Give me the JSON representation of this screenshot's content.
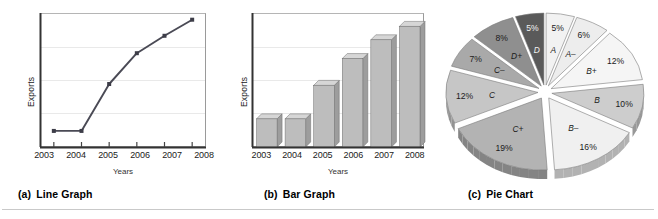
{
  "figure": {
    "bottom_rule": true
  },
  "panels": {
    "line": {
      "caption_index": "(a)",
      "caption_label": "Line Graph",
      "y_axis_label": "Exports",
      "x_axis_title": "Years"
    },
    "bar": {
      "caption_index": "(b)",
      "caption_label": "Bar Graph",
      "y_axis_label": "Exports",
      "x_axis_title": "Years"
    },
    "pie": {
      "caption_index": "(c)",
      "caption_label": "Pie Chart"
    }
  },
  "chart_data": [
    {
      "type": "line",
      "title": "Line Graph",
      "xlabel": "Years",
      "ylabel": "Exports",
      "categories": [
        "2003",
        "2004",
        "2005",
        "2006",
        "2007",
        "2008"
      ],
      "values": [
        12,
        12,
        47,
        70,
        83,
        95
      ],
      "ylim": [
        0,
        100
      ],
      "grid": true,
      "legend": "none",
      "marker": "square"
    },
    {
      "type": "bar",
      "title": "Bar Graph",
      "xlabel": "Years",
      "ylabel": "Exports",
      "categories": [
        "2003",
        "2004",
        "2005",
        "2006",
        "2007",
        "2008"
      ],
      "values": [
        21,
        21,
        46,
        66,
        80,
        90
      ],
      "ylim": [
        0,
        100
      ],
      "grid": true,
      "legend": "none",
      "style": "3d"
    },
    {
      "type": "pie",
      "title": "Pie Chart",
      "exploded": true,
      "labels": [
        "A",
        "A–",
        "B+",
        "B",
        "B–",
        "C+",
        "C",
        "C–",
        "D+",
        "D"
      ],
      "values": [
        5,
        6,
        12,
        10,
        16,
        19,
        12,
        7,
        8,
        5
      ],
      "value_labels": [
        "5%",
        "6%",
        "12%",
        "10%",
        "16%",
        "19%",
        "12%",
        "7%",
        "8%",
        "5%"
      ],
      "colors": [
        "#f2f2f2",
        "#ededed",
        "#f5f5f5",
        "#cdcdcd",
        "#f0f0f0",
        "#b3b3b3",
        "#c6c6c6",
        "#a9a9a9",
        "#8f8f8f",
        "#5a5a5a"
      ],
      "legend": "none"
    }
  ],
  "line_chart": {
    "ticks": [
      "2003",
      "2004",
      "2005",
      "2006",
      "2007",
      "2008"
    ],
    "points": [
      {
        "x": 0,
        "y": 12
      },
      {
        "x": 1,
        "y": 12
      },
      {
        "x": 2,
        "y": 47
      },
      {
        "x": 3,
        "y": 70
      },
      {
        "x": 4,
        "y": 83
      },
      {
        "x": 5,
        "y": 95
      }
    ]
  },
  "bar_chart": {
    "ticks": [
      "2003",
      "2004",
      "2005",
      "2006",
      "2007",
      "2008"
    ],
    "bars": [
      {
        "label": "2003",
        "value": 21
      },
      {
        "label": "2004",
        "value": 21
      },
      {
        "label": "2005",
        "value": 46
      },
      {
        "label": "2006",
        "value": 66
      },
      {
        "label": "2007",
        "value": 80
      },
      {
        "label": "2008",
        "value": 90
      }
    ]
  },
  "pie_chart": {
    "slices": [
      {
        "grade": "A",
        "pct": "5%",
        "value": 5,
        "fill": "#f2f2f2",
        "dark_text": true
      },
      {
        "grade": "A–",
        "pct": "6%",
        "value": 6,
        "fill": "#ededed",
        "dark_text": true
      },
      {
        "grade": "B+",
        "pct": "12%",
        "value": 12,
        "fill": "#f5f5f5",
        "dark_text": true
      },
      {
        "grade": "B",
        "pct": "10%",
        "value": 10,
        "fill": "#cdcdcd",
        "dark_text": true
      },
      {
        "grade": "B–",
        "pct": "16%",
        "value": 16,
        "fill": "#f0f0f0",
        "dark_text": true
      },
      {
        "grade": "C+",
        "pct": "19%",
        "value": 19,
        "fill": "#b3b3b3",
        "dark_text": true
      },
      {
        "grade": "C",
        "pct": "12%",
        "value": 12,
        "fill": "#c6c6c6",
        "dark_text": true
      },
      {
        "grade": "C–",
        "pct": "7%",
        "value": 7,
        "fill": "#a9a9a9",
        "dark_text": true
      },
      {
        "grade": "D+",
        "pct": "8%",
        "value": 8,
        "fill": "#8f8f8f",
        "dark_text": true
      },
      {
        "grade": "D",
        "pct": "5%",
        "value": 5,
        "fill": "#5a5a5a",
        "dark_text": false
      }
    ]
  }
}
